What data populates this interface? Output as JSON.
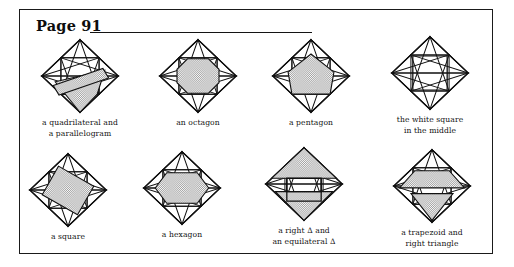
{
  "page": {
    "title": "Page 91",
    "background_color": "#ffffff",
    "ink_color": "#111111",
    "shade_color": "#c9c9c9",
    "frame": "rectangular border around whole worksheet"
  },
  "figures": [
    {
      "id": "quadrilateral-parallelogram",
      "caption": "a quadrilateral and\na parallelogram",
      "shape_name": "quadrilateral and parallelogram",
      "shaded_region": "two overlapping shaded quadrilaterals crossing the diamond"
    },
    {
      "id": "octagon",
      "caption": "an octagon",
      "shape_name": "octagon",
      "shaded_region": "central octagon"
    },
    {
      "id": "pentagon",
      "caption": "a pentagon",
      "shape_name": "pentagon",
      "shaded_region": "central pentagon"
    },
    {
      "id": "white-square-middle",
      "caption": "the white square\nin the middle",
      "shape_name": "white square in the middle",
      "shaded_region": "none - centre square left white"
    },
    {
      "id": "square",
      "caption": "a square",
      "shape_name": "square",
      "shaded_region": "central tilted square"
    },
    {
      "id": "hexagon",
      "caption": "a hexagon",
      "shape_name": "hexagon",
      "shaded_region": "central hexagon"
    },
    {
      "id": "right-and-equilateral-triangle",
      "caption": "a right Δ and\nan equilateral Δ",
      "shape_name": "right triangle and equilateral triangle",
      "shaded_region": "upper equilateral triangle and lower right triangle, white square between"
    },
    {
      "id": "trapezoid-right-triangle",
      "caption": "a trapezoid and\nright triangle",
      "shape_name": "trapezoid and right triangle",
      "shaded_region": "upper trapezoid and lower triangle"
    }
  ]
}
